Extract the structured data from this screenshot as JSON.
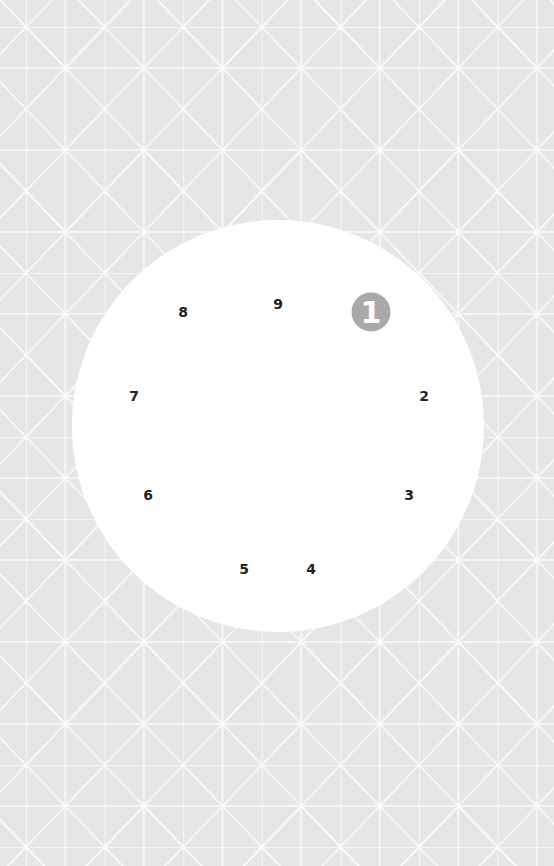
{
  "puzzle": {
    "type": "dot-to-dot circle",
    "start_badge": {
      "label": "1",
      "x": 371,
      "y": 312,
      "color": "#a9a9a9"
    },
    "points": [
      {
        "label": "2",
        "x": 424,
        "y": 396
      },
      {
        "label": "3",
        "x": 409,
        "y": 495
      },
      {
        "label": "4",
        "x": 311,
        "y": 569
      },
      {
        "label": "5",
        "x": 244,
        "y": 569
      },
      {
        "label": "6",
        "x": 148,
        "y": 495
      },
      {
        "label": "7",
        "x": 134,
        "y": 396
      },
      {
        "label": "8",
        "x": 183,
        "y": 312
      },
      {
        "label": "9",
        "x": 278,
        "y": 304
      }
    ]
  },
  "colors": {
    "background": "#e6e6e6",
    "pattern_lines": "#fafafa",
    "board": "#ffffff",
    "number_text": "#222222"
  }
}
